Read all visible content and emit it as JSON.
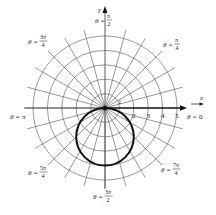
{
  "figure": {
    "type": "polar_graph",
    "center_px": [
      105,
      108
    ],
    "unit_px": 14.4,
    "grid": {
      "radii": [
        1,
        2,
        3,
        4,
        5
      ],
      "spoke_step_deg": 15,
      "spoke_extent": 5.6,
      "grid_color": "#555555"
    },
    "axes": {
      "x_label": "x",
      "y_label": "y",
      "polar_axis_ticks": [
        "1",
        "2",
        "3",
        "4",
        "5"
      ]
    },
    "angle_labels": [
      {
        "name": "theta-0",
        "prefix": "θ = ",
        "num": "0",
        "den": ""
      },
      {
        "name": "theta-pi-over-4",
        "prefix": "θ = ",
        "num": "π",
        "den": "4"
      },
      {
        "name": "theta-pi-over-2",
        "prefix": "θ = ",
        "num": "π",
        "den": "2"
      },
      {
        "name": "theta-3pi-over-4",
        "prefix": "θ = ",
        "num": "3π",
        "den": "4"
      },
      {
        "name": "theta-pi",
        "prefix": "θ = ",
        "num": "π",
        "den": ""
      },
      {
        "name": "theta-5pi-over-4",
        "prefix": "θ = ",
        "num": "5π",
        "den": "4"
      },
      {
        "name": "theta-3pi-over-2",
        "prefix": "θ = ",
        "num": "3π",
        "den": "2"
      },
      {
        "name": "theta-7pi-over-4",
        "prefix": "θ = ",
        "num": "7π",
        "den": "4"
      }
    ],
    "curve": {
      "description": "circle r = -4 sin θ",
      "center_polar_xy": [
        0,
        -2
      ],
      "radius": 2,
      "stroke_color": "#111111"
    }
  }
}
